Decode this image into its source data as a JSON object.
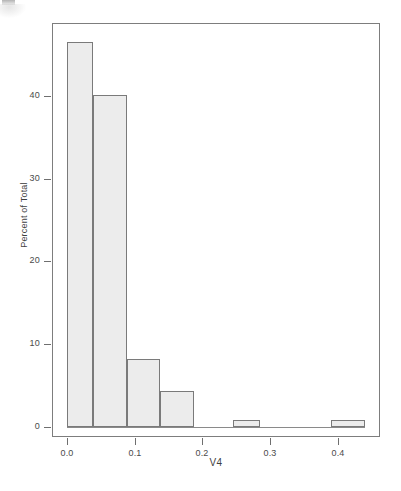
{
  "figure": {
    "background_color": "#ffffff",
    "frame_color": "#7d7d7d",
    "bar_fill_color": "#ececec",
    "bar_border_color": "#7a7a7a",
    "text_color": "#3f3f3f"
  },
  "chart_data": {
    "type": "bar",
    "title": "",
    "subtitle": "",
    "xlabel": "V4",
    "ylabel": "Percent of Total",
    "grid": false,
    "legend": false,
    "legend_position": "none",
    "xlim": [
      -0.022,
      0.462
    ],
    "ylim": [
      -1.2,
      48.8
    ],
    "xticks": [
      0.0,
      0.1,
      0.2,
      0.3,
      0.4
    ],
    "xtick_labels": [
      "0.0",
      "0.1",
      "0.2",
      "0.3",
      "0.4"
    ],
    "yticks": [
      0,
      10,
      20,
      30,
      40
    ],
    "ytick_labels": [
      "0",
      "10",
      "20",
      "30",
      "40"
    ],
    "bin_edges": [
      0.0,
      0.039,
      0.088,
      0.138,
      0.188,
      0.245,
      0.285,
      0.39,
      0.44
    ],
    "bars": [
      {
        "x_start": 0.0,
        "x_end": 0.039,
        "value": 46.5
      },
      {
        "x_start": 0.039,
        "x_end": 0.088,
        "value": 40.1
      },
      {
        "x_start": 0.088,
        "x_end": 0.138,
        "value": 8.2
      },
      {
        "x_start": 0.138,
        "x_end": 0.188,
        "value": 4.3
      },
      {
        "x_start": 0.245,
        "x_end": 0.285,
        "value": 0.8
      },
      {
        "x_start": 0.39,
        "x_end": 0.44,
        "value": 0.9
      }
    ],
    "categories": [
      "0.000-0.039",
      "0.039-0.088",
      "0.088-0.138",
      "0.138-0.188",
      "0.245-0.285",
      "0.390-0.440"
    ],
    "values": [
      46.5,
      40.1,
      8.2,
      4.3,
      0.8,
      0.9
    ]
  }
}
